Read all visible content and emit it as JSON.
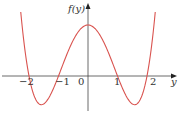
{
  "chart_data": {
    "type": "line",
    "title": "",
    "xlabel": "y",
    "ylabel": "f(y)",
    "function": "f(y) = y^4 - 5y^2 + 4",
    "x_ticks": [
      "-2",
      "-1",
      "0",
      "1",
      "2"
    ],
    "x_tick_values": [
      -2,
      -1,
      0,
      1,
      2
    ],
    "xlim": [
      -2.35,
      2.35
    ],
    "ylim": [
      -2.6,
      5.6
    ],
    "grid": false,
    "legend": null,
    "series": [
      {
        "name": "f(y)",
        "color": "#d9534f",
        "x": [
          -2.35,
          -2.2,
          -2.0,
          -1.8,
          -1.58,
          -1.4,
          -1.2,
          -1.0,
          -0.8,
          -0.5,
          0.0,
          0.5,
          0.8,
          1.0,
          1.2,
          1.4,
          1.58,
          1.8,
          2.0,
          2.2,
          2.35
        ],
        "values": [
          6.89,
          2.23,
          0.0,
          -1.7,
          -2.25,
          -1.96,
          -1.13,
          0.0,
          1.21,
          2.81,
          4.0,
          2.81,
          1.21,
          0.0,
          -1.13,
          -1.96,
          -2.25,
          -1.7,
          0.0,
          2.23,
          6.89
        ]
      }
    ],
    "zeros": [
      -2,
      -1,
      1,
      2
    ],
    "maximum": {
      "x": 0,
      "y": 4
    },
    "minima": [
      {
        "x": -1.58,
        "y": -2.25
      },
      {
        "x": 1.58,
        "y": -2.25
      }
    ]
  },
  "labels": {
    "y_axis": "f(y)",
    "x_axis": "y",
    "tick_neg2": "−2",
    "tick_neg1": "−1",
    "tick_0": "0",
    "tick_1": "1",
    "tick_2": "2"
  },
  "colors": {
    "curve": "#d9534f",
    "axis": "#444444"
  }
}
